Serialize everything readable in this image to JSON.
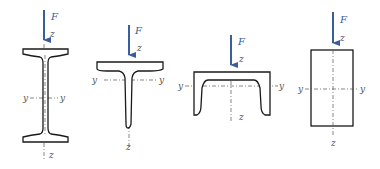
{
  "diagram": {
    "colors": {
      "force_arrow": "#3a5d9c",
      "outline": "#1a1a1a",
      "axis": "#555555"
    },
    "sections": [
      {
        "id": "i-beam",
        "shape": "I-section",
        "force_label": "F",
        "z_top": "z",
        "z_bottom": "z",
        "y_left": "y",
        "y_right": "y"
      },
      {
        "id": "t-beam",
        "shape": "T-section",
        "force_label": "F",
        "z_top": "z",
        "z_bottom": "z",
        "y_left": "y",
        "y_right": "y"
      },
      {
        "id": "channel",
        "shape": "Inverted channel (U) section",
        "force_label": "F",
        "z_top": "z",
        "z_bottom": "z",
        "y_left": "y",
        "y_right": "y"
      },
      {
        "id": "rectangle",
        "shape": "Rectangular section",
        "force_label": "F",
        "z_top": "z",
        "z_bottom": "z",
        "y_left": "y",
        "y_right": "y"
      }
    ]
  }
}
